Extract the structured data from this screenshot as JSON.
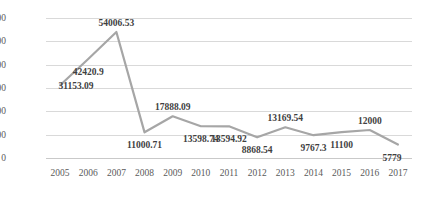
{
  "chart_data": {
    "type": "line",
    "title": "",
    "subtitle": "",
    "xlabel": "",
    "ylabel": "",
    "categories": [
      "2005",
      "2006",
      "2007",
      "2008",
      "2009",
      "2010",
      "2011",
      "2012",
      "2013",
      "2014",
      "2015",
      "2016",
      "2017"
    ],
    "values": [
      31153.09,
      42420.9,
      54006.53,
      11000.71,
      17888.09,
      13598.74,
      13594.92,
      8868.54,
      13169.54,
      9767.3,
      11100,
      12000,
      5779
    ],
    "point_labels": [
      "31153.09",
      "42420.9",
      "54006.53",
      "11000.71",
      "17888.09",
      "13598.74",
      "13594.92",
      "8868.54",
      "13169.54",
      "9767.3",
      "11100",
      "12000",
      "5779"
    ],
    "series": [
      {
        "name": "Series 1",
        "color": "#a6a6a6",
        "values": [
          31153.09,
          42420.9,
          54006.53,
          11000.71,
          17888.09,
          13598.74,
          13594.92,
          8868.54,
          13169.54,
          9767.3,
          11100,
          12000,
          5779
        ]
      }
    ],
    "yticks": [
      0,
      10000,
      20000,
      30000,
      40000,
      50000,
      60000
    ],
    "ytick_labels": [
      "0",
      "10000",
      "20000",
      "30000",
      "40000",
      "50000",
      "60000"
    ],
    "ylim": [
      0,
      60000
    ],
    "grid": true,
    "grid_color": "#d9d9d9",
    "legend": false,
    "legend_position": "none",
    "background": "#ffffff",
    "label_color": "#3f3f3f",
    "tick_color": "#5a5a5a"
  }
}
